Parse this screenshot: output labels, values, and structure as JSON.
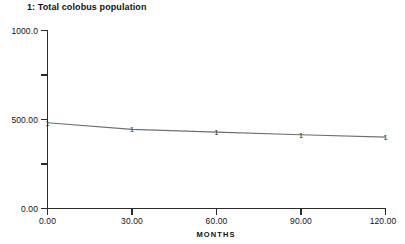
{
  "chart_data": {
    "type": "line",
    "title": "1: Total colobus population",
    "xlabel": "MONTHS",
    "ylabel": "",
    "xlim": [
      0,
      120
    ],
    "ylim": [
      0,
      1000
    ],
    "grid": false,
    "legend": "none",
    "series_marker_label": "1",
    "line_color": "#6f6f6f",
    "axis_color": "#2b2b2b",
    "background_color": "#ffffff",
    "x": [
      0,
      30,
      60,
      90,
      120
    ],
    "xtick_labels": [
      "0.00",
      "30.00",
      "60.00",
      "90.00",
      "120.00"
    ],
    "ytick_labels": [
      "1000.0",
      "500.00",
      "0.00"
    ],
    "ytick_values": [
      1000,
      500,
      0
    ],
    "yminor_values": [
      750,
      250
    ],
    "series": [
      {
        "name": "1: Total colobus population",
        "values": [
          480,
          443,
          428,
          413,
          400
        ]
      }
    ]
  }
}
